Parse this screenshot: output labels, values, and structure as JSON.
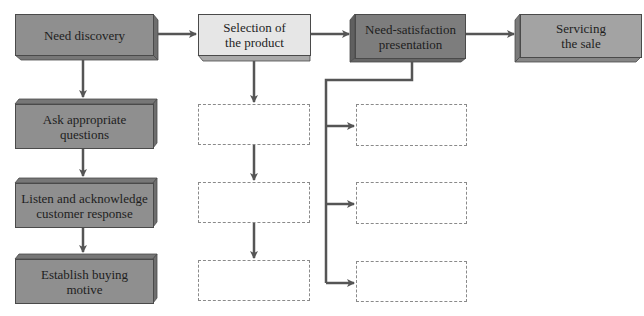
{
  "diagram": {
    "type": "flowchart",
    "title": "",
    "nodes": [
      {
        "id": "need-discovery",
        "label": "Need discovery",
        "style": "dark",
        "row": 0,
        "col": 0
      },
      {
        "id": "selection-of-product",
        "label": "Selection of\nthe product",
        "line1": "Selection of",
        "line2": "the product",
        "style": "light",
        "row": 0,
        "col": 1
      },
      {
        "id": "need-satisfaction",
        "label": "Need-satisfaction\npresentation",
        "line1": "Need-satisfaction",
        "line2": "presentation",
        "style": "darkest",
        "row": 0,
        "col": 2
      },
      {
        "id": "servicing-sale",
        "label": "Servicing\nthe sale",
        "line1": "Servicing",
        "line2": "the sale",
        "style": "medium",
        "row": 0,
        "col": 3
      },
      {
        "id": "ask-questions",
        "label": "Ask appropriate\nquestions",
        "line1": "Ask appropriate",
        "line2": "questions",
        "style": "dark",
        "row": 1,
        "col": 0
      },
      {
        "id": "listen-acknowledge",
        "label": "Listen and acknowledge\ncustomer response",
        "line1": "Listen and acknowledge",
        "line2": "customer response",
        "style": "dark",
        "row": 2,
        "col": 0
      },
      {
        "id": "establish-motive",
        "label": "Establish buying\nmotive",
        "line1": "Establish buying",
        "line2": "motive",
        "style": "dark",
        "row": 3,
        "col": 0
      },
      {
        "id": "blank-mid-1",
        "label": "",
        "style": "dashed-empty",
        "row": 1,
        "col": 1
      },
      {
        "id": "blank-mid-2",
        "label": "",
        "style": "dashed-empty",
        "row": 2,
        "col": 1
      },
      {
        "id": "blank-mid-3",
        "label": "",
        "style": "dashed-empty",
        "row": 3,
        "col": 1
      },
      {
        "id": "blank-right-1",
        "label": "",
        "style": "dashed-empty",
        "row": 1,
        "col": 2
      },
      {
        "id": "blank-right-2",
        "label": "",
        "style": "dashed-empty",
        "row": 2,
        "col": 2
      },
      {
        "id": "blank-right-3",
        "label": "",
        "style": "dashed-empty",
        "row": 3,
        "col": 2
      }
    ],
    "edges": [
      {
        "from": "need-discovery",
        "to": "selection-of-product"
      },
      {
        "from": "selection-of-product",
        "to": "need-satisfaction"
      },
      {
        "from": "need-satisfaction",
        "to": "servicing-sale"
      },
      {
        "from": "need-discovery",
        "to": "ask-questions"
      },
      {
        "from": "ask-questions",
        "to": "listen-acknowledge"
      },
      {
        "from": "listen-acknowledge",
        "to": "establish-motive"
      },
      {
        "from": "selection-of-product",
        "to": "blank-mid-1"
      },
      {
        "from": "blank-mid-1",
        "to": "blank-mid-2"
      },
      {
        "from": "blank-mid-2",
        "to": "blank-mid-3"
      },
      {
        "from": "need-satisfaction",
        "to": "blank-right-1"
      },
      {
        "from": "need-satisfaction",
        "to": "blank-right-2"
      },
      {
        "from": "need-satisfaction",
        "to": "blank-right-3"
      }
    ],
    "colors": {
      "dark_front": "#8f8f8f",
      "dark_side": "#6e6e6e",
      "light_front": "#e6e6e6",
      "light_side": "#b5b5b5",
      "darkest_front": "#7d7d7d",
      "medium_front": "#a3a3a3",
      "arrow": "#555555",
      "dashed_border": "#8a8a8a"
    }
  }
}
